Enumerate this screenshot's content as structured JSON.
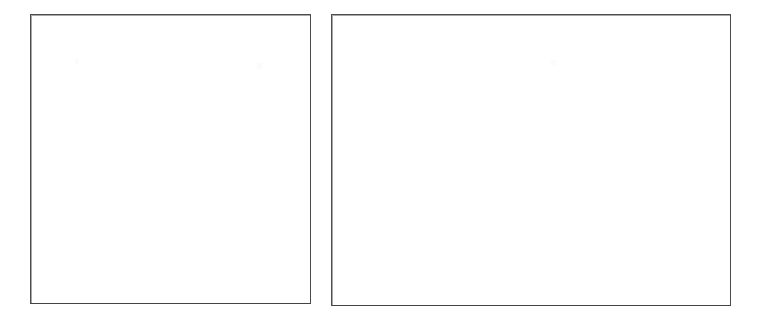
{
  "page": {
    "background_color": "#ffffff",
    "width": 759,
    "height": 330,
    "content_text": ""
  },
  "figures": [
    {
      "name": "left-figure-placeholder",
      "shape": "rectangle",
      "orientation": "portrait-square",
      "caption": "",
      "interior_text": "",
      "border_color": "#4d4d4d",
      "fill_color": "#ffffff",
      "border_width_px": 1,
      "x": 30,
      "y": 14,
      "width": 281,
      "height": 290
    },
    {
      "name": "right-figure-placeholder",
      "shape": "rectangle",
      "orientation": "landscape",
      "caption": "",
      "interior_text": "",
      "border_color": "#4a4a4a",
      "fill_color": "#ffffff",
      "border_width_px": 1,
      "x": 331,
      "y": 14,
      "width": 400,
      "height": 292
    }
  ],
  "artifacts": {
    "description": "faint scanner speckles",
    "color": "#fbfbfb"
  }
}
